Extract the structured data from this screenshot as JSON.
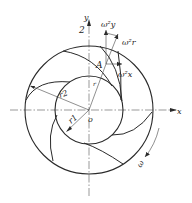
{
  "diagram": {
    "type": "centrifugal-impeller-velocity-diagram",
    "center": {
      "label": "o",
      "x": 89,
      "y": 110
    },
    "outer_circle": {
      "radius": 64,
      "label": "r2"
    },
    "inner_circle": {
      "radius": 34,
      "label": "r1"
    },
    "blade_count": 6,
    "axes": {
      "x_label": "x",
      "y_label": "y",
      "y_top_marker": "2"
    },
    "point": {
      "label": "A",
      "radius_label": "r"
    },
    "vectors": {
      "radial": "ω²r",
      "y_component": "ω²y",
      "x_component": "ω²x"
    },
    "rotation": {
      "label": "ω"
    },
    "colors": {
      "stroke": "#2a2a2a",
      "background": "#ffffff"
    }
  }
}
